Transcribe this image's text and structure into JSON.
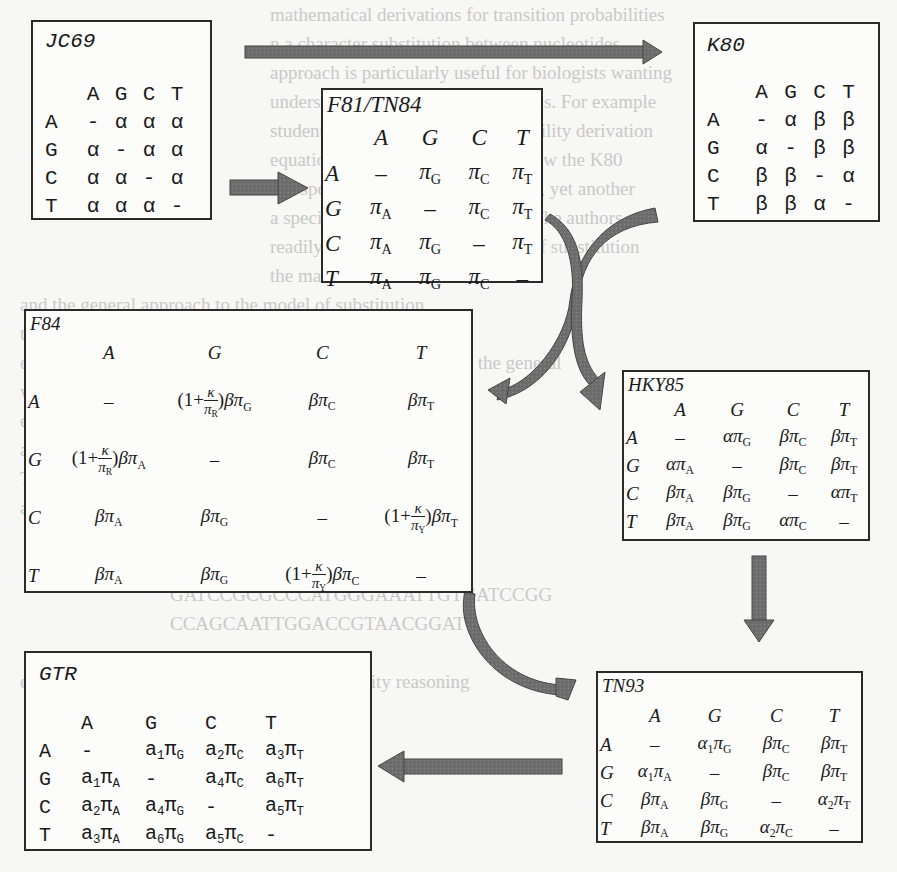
{
  "diagram": {
    "type": "model-hierarchy",
    "nodes": [
      {
        "id": "JC69",
        "title": "JC69",
        "columns": [
          "A",
          "G",
          "C",
          "T"
        ],
        "rows": [
          {
            "label": "A",
            "cells": [
              "-",
              "α",
              "α",
              "α"
            ]
          },
          {
            "label": "G",
            "cells": [
              "α",
              "-",
              "α",
              "α"
            ]
          },
          {
            "label": "C",
            "cells": [
              "α",
              "α",
              "-",
              "α"
            ]
          },
          {
            "label": "T",
            "cells": [
              "α",
              "α",
              "α",
              "-"
            ]
          }
        ]
      },
      {
        "id": "K80",
        "title": "K80",
        "columns": [
          "A",
          "G",
          "C",
          "T"
        ],
        "rows": [
          {
            "label": "A",
            "cells": [
              "-",
              "α",
              "β",
              "β"
            ]
          },
          {
            "label": "G",
            "cells": [
              "α",
              "-",
              "β",
              "β"
            ]
          },
          {
            "label": "C",
            "cells": [
              "β",
              "β",
              "-",
              "α"
            ]
          },
          {
            "label": "T",
            "cells": [
              "β",
              "β",
              "α",
              "-"
            ]
          }
        ]
      },
      {
        "id": "F81",
        "title": "F81/TN84",
        "columns": [
          "A",
          "G",
          "C",
          "T"
        ],
        "rows": [
          {
            "label": "A",
            "cells": [
              "–",
              "π_G",
              "π_C",
              "π_T"
            ]
          },
          {
            "label": "G",
            "cells": [
              "π_A",
              "–",
              "π_C",
              "π_T"
            ]
          },
          {
            "label": "C",
            "cells": [
              "π_A",
              "π_G",
              "–",
              "π_T"
            ]
          },
          {
            "label": "T",
            "cells": [
              "π_A",
              "π_G",
              "π_C",
              "–"
            ]
          }
        ]
      },
      {
        "id": "F84",
        "title": "F84",
        "columns": [
          "A",
          "G",
          "C",
          "T"
        ],
        "rows": [
          {
            "label": "A",
            "cells": [
              "–",
              "(1+κ/π_R)βπ_G",
              "βπ_C",
              "βπ_T"
            ]
          },
          {
            "label": "G",
            "cells": [
              "(1+κ/π_R)βπ_A",
              "–",
              "βπ_C",
              "βπ_T"
            ]
          },
          {
            "label": "C",
            "cells": [
              "βπ_A",
              "βπ_G",
              "–",
              "(1+κ/π_Y)βπ_T"
            ]
          },
          {
            "label": "T",
            "cells": [
              "βπ_A",
              "βπ_G",
              "(1+κ/π_Y)βπ_C",
              "–"
            ]
          }
        ]
      },
      {
        "id": "HKY85",
        "title": "HKY85",
        "columns": [
          "A",
          "G",
          "C",
          "T"
        ],
        "rows": [
          {
            "label": "A",
            "cells": [
              "–",
              "απ_G",
              "βπ_C",
              "βπ_T"
            ]
          },
          {
            "label": "G",
            "cells": [
              "απ_A",
              "–",
              "βπ_C",
              "βπ_T"
            ]
          },
          {
            "label": "C",
            "cells": [
              "βπ_A",
              "βπ_G",
              "–",
              "απ_T"
            ]
          },
          {
            "label": "T",
            "cells": [
              "βπ_A",
              "βπ_G",
              "απ_C",
              "–"
            ]
          }
        ]
      },
      {
        "id": "TN93",
        "title": "TN93",
        "columns": [
          "A",
          "G",
          "C",
          "T"
        ],
        "rows": [
          {
            "label": "A",
            "cells": [
              "–",
              "α₁π_G",
              "βπ_C",
              "βπ_T"
            ]
          },
          {
            "label": "G",
            "cells": [
              "α₁π_A",
              "–",
              "βπ_C",
              "βπ_T"
            ]
          },
          {
            "label": "C",
            "cells": [
              "βπ_A",
              "βπ_G",
              "–",
              "α₂π_T"
            ]
          },
          {
            "label": "T",
            "cells": [
              "βπ_A",
              "βπ_G",
              "α₂π_C",
              "–"
            ]
          }
        ]
      },
      {
        "id": "GTR",
        "title": "GTR",
        "columns": [
          "A",
          "G",
          "C",
          "T"
        ],
        "rows": [
          {
            "label": "A",
            "cells": [
              "-",
              "a₁π_G",
              "a₂π_C",
              "a₃π_T"
            ]
          },
          {
            "label": "G",
            "cells": [
              "a₁π_A",
              "-",
              "a₄π_C",
              "a₆π_T"
            ]
          },
          {
            "label": "C",
            "cells": [
              "a₂π_A",
              "a₄π_G",
              "-",
              "a₅π_T"
            ]
          },
          {
            "label": "T",
            "cells": [
              "a₃π_A",
              "a₆π_G",
              "a₅π_C",
              "-"
            ]
          }
        ]
      }
    ],
    "edges": [
      {
        "from": "JC69",
        "to": "K80",
        "style": "straight-horizontal"
      },
      {
        "from": "JC69",
        "to": "F81",
        "style": "straight-horizontal"
      },
      {
        "from": "K80",
        "to": "F84",
        "style": "curved"
      },
      {
        "from": "F81",
        "to": "HKY85",
        "style": "curved"
      },
      {
        "from": "F84",
        "to": "TN93",
        "style": "curved"
      },
      {
        "from": "HKY85",
        "to": "TN93",
        "style": "straight-vertical"
      },
      {
        "from": "TN93",
        "to": "GTR",
        "style": "straight-horizontal"
      }
    ],
    "arrow_color": "#6e6e6e",
    "border_color": "#2a2a2a"
  },
  "labels": {
    "jc69": "JC69",
    "k80": "K80",
    "f81": "F81/TN84",
    "f84": "F84",
    "hky85": "HKY85",
    "tn93": "TN93",
    "gtr": "GTR"
  }
}
